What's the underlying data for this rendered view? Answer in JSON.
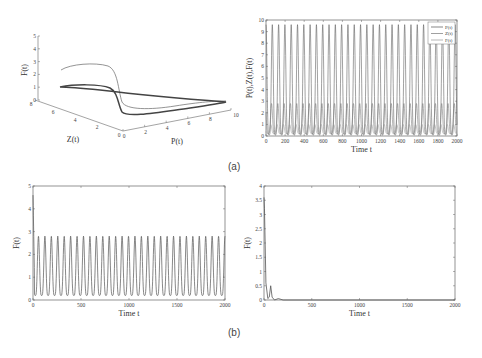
{
  "captions": {
    "a": "(a)",
    "b": "(b)"
  },
  "chart_data": [
    {
      "id": "a-left",
      "type": "line3d",
      "title": "",
      "xlabel": "P(t)",
      "ylabel": "Z(t)",
      "zlabel": "F(t)",
      "x_ticks": [
        "0",
        "2",
        "4",
        "6",
        "8",
        "10"
      ],
      "y_ticks": [
        "0",
        "2",
        "4",
        "6",
        "8"
      ],
      "z_ticks": [
        "0",
        "1",
        "2",
        "3",
        "4",
        "5"
      ],
      "xlim": [
        0,
        10
      ],
      "ylim": [
        0,
        8
      ],
      "zlim": [
        0,
        5
      ],
      "description": "Phase-space trajectory converging to a limit cycle; transient starts near F=2.3 and settles to a loop with F between ~0 and ~1"
    },
    {
      "id": "a-right",
      "type": "line",
      "title": "",
      "xlabel": "Time t",
      "ylabel": "P(t),Z(t),F(t)",
      "x_ticks": [
        "0",
        "200",
        "400",
        "600",
        "800",
        "1000",
        "1200",
        "1400",
        "1600",
        "1800",
        "2000"
      ],
      "y_ticks": [
        "0",
        "1",
        "2",
        "3",
        "4",
        "5",
        "6",
        "7",
        "8",
        "9",
        "10"
      ],
      "xlim": [
        0,
        2000
      ],
      "ylim": [
        0,
        10
      ],
      "legend": [
        "P(t)",
        "Z(t)",
        "F(t)"
      ],
      "legend_position": "upper right",
      "series": [
        {
          "name": "P(t)",
          "period": 66,
          "min": 0.1,
          "max": 9.6
        },
        {
          "name": "Z(t)",
          "period": 66,
          "min": 0.2,
          "max": 2.8
        },
        {
          "name": "F(t)",
          "period": 66,
          "min": 0.2,
          "max": 1.0
        }
      ]
    },
    {
      "id": "b-left",
      "type": "line",
      "title": "",
      "xlabel": "Time t",
      "ylabel": "F(t)",
      "x_ticks": [
        "0",
        "500",
        "1000",
        "1500",
        "2000"
      ],
      "y_ticks": [
        "0",
        "1",
        "2",
        "3",
        "4",
        "5"
      ],
      "xlim": [
        0,
        2000
      ],
      "ylim": [
        0,
        5
      ],
      "series": [
        {
          "name": "F(t)",
          "initial_peak": 4.6,
          "period": 67,
          "min": 0.2,
          "max": 2.8,
          "cycles": 30
        }
      ]
    },
    {
      "id": "b-right",
      "type": "line",
      "title": "",
      "xlabel": "Time t",
      "ylabel": "F(t)",
      "x_ticks": [
        "0",
        "500",
        "1000",
        "1500",
        "2000"
      ],
      "y_ticks": [
        "0",
        "0.5",
        "1",
        "1.5",
        "2",
        "2.5",
        "3",
        "3.5",
        "4"
      ],
      "xlim": [
        0,
        2000
      ],
      "ylim": [
        0,
        4
      ],
      "series": [
        {
          "name": "F(t)",
          "x": [
            0,
            5,
            20,
            40,
            55,
            70,
            85,
            110,
            150,
            200,
            2000
          ],
          "values": [
            3.6,
            3.2,
            0.6,
            0.05,
            0.1,
            0.5,
            0.1,
            0.0,
            0.05,
            0.0,
            0.0
          ]
        }
      ]
    }
  ]
}
